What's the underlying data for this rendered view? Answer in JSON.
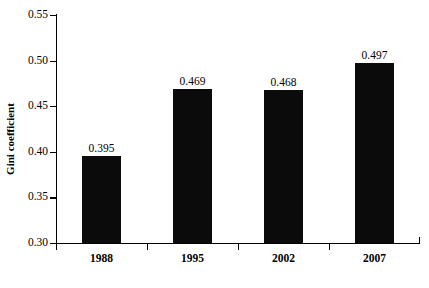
{
  "chart_data": {
    "type": "bar",
    "title": "",
    "subtitle": "",
    "xlabel": "",
    "ylabel": "Gini coefficient",
    "categories": [
      "1988",
      "1995",
      "2002",
      "2007"
    ],
    "values": [
      0.395,
      0.469,
      0.468,
      0.497
    ],
    "value_labels": [
      "0.395",
      "0.469",
      "0.468",
      "0.497"
    ],
    "ylim": [
      0.3,
      0.55
    ],
    "ytick_labels": [
      "0.55",
      "0.50",
      "0.45",
      "0.40",
      "0.35",
      "0.30"
    ],
    "ytick_values": [
      0.55,
      0.5,
      0.45,
      0.4,
      0.35,
      0.3
    ],
    "grid": false,
    "legend": false,
    "legend_position": "none",
    "series": [
      {
        "name": "Gini coefficient",
        "values": [
          0.395,
          0.469,
          0.468,
          0.497
        ],
        "color": "#0b0b0b"
      }
    ]
  },
  "colors": {
    "bar": "#0b0b0b",
    "axis": "#000000",
    "background": "#ffffff",
    "text": "#000000"
  }
}
